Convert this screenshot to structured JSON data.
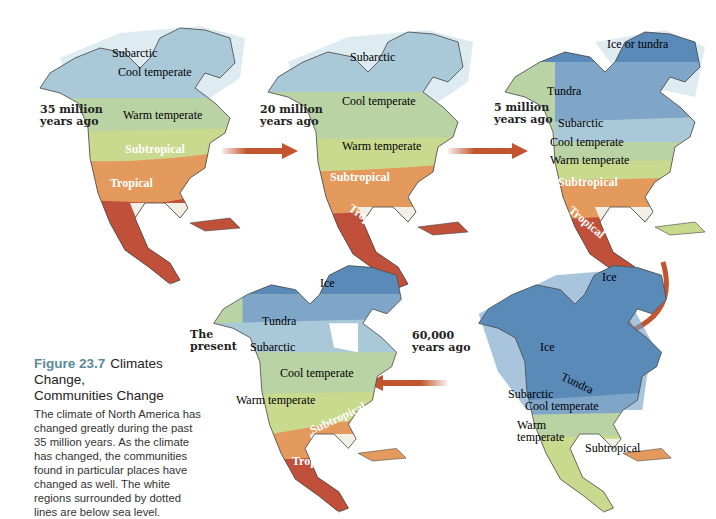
{
  "figure": {
    "number": "Figure 23.7",
    "title_line1": "Climates Change,",
    "title_line2": "Communities Change",
    "body": "The climate of North America has changed greatly during the past 35 million years. As the climate has changed, the communities found in particular places have changed as well. The white regions surrounded by dotted lines are below sea level."
  },
  "colors": {
    "ice": "#5a8ab8",
    "tundra": "#7fa6c9",
    "subarctic": "#a9c8d8",
    "cool_temperate": "#b9d3a4",
    "warm_temperate": "#c9d98e",
    "subtropical": "#e49a5c",
    "tropical": "#c0503a",
    "arrow": "#c2552f"
  },
  "maps": [
    {
      "era": "35 million years ago",
      "era_line1": "35 million",
      "era_line2": "years ago",
      "zones": [
        "Subarctic",
        "Cool temperate",
        "Warm temperate",
        "Subtropical",
        "Tropical"
      ]
    },
    {
      "era": "20 million years ago",
      "era_line1": "20 million",
      "era_line2": "years ago",
      "zones": [
        "Subarctic",
        "Cool temperate",
        "Warm temperate",
        "Subtropical",
        "Tropical"
      ]
    },
    {
      "era": "5 million years ago",
      "era_line1": "5 million",
      "era_line2": "years ago",
      "zones": [
        "Ice or tundra",
        "Tundra",
        "Subarctic",
        "Cool temperate",
        "Warm temperate",
        "Subtropical",
        "Tropical"
      ]
    },
    {
      "era": "60,000 years ago",
      "era_line1": "60,000",
      "era_line2": "years ago",
      "zones": [
        "Ice",
        "Ice",
        "Tundra",
        "Subarctic",
        "Cool temperate",
        "Warm",
        "temperate",
        "Subtropical"
      ]
    },
    {
      "era": "The present",
      "era_line1": "The",
      "era_line2": "present",
      "zones": [
        "Ice",
        "Tundra",
        "Subarctic",
        "Cool temperate",
        "Warm temperate",
        "Subtropical",
        "Tropical"
      ]
    }
  ]
}
